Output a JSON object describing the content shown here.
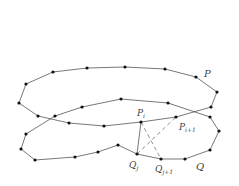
{
  "diagram": {
    "colors": {
      "line": "#555555",
      "point": "#111111",
      "label": "#444444"
    },
    "polygons": {
      "P": {
        "label": "P",
        "points": [
          [
            19,
            103
          ],
          [
            26,
            84
          ],
          [
            53,
            72
          ],
          [
            87,
            68
          ],
          [
            125,
            67
          ],
          [
            165,
            69
          ],
          [
            196,
            77
          ],
          [
            217,
            92
          ],
          [
            211,
            107
          ],
          [
            176,
            117
          ],
          [
            141,
            122
          ],
          [
            104,
            126
          ],
          [
            69,
            123
          ],
          [
            38,
            116
          ]
        ]
      },
      "Q": {
        "label": "Q",
        "points": [
          [
            55,
            116
          ],
          [
            82,
            107
          ],
          [
            121,
            99
          ],
          [
            168,
            103
          ],
          [
            210,
            117
          ],
          [
            219,
            131
          ],
          [
            210,
            150
          ],
          [
            185,
            159
          ],
          [
            161,
            159
          ],
          [
            137,
            154
          ],
          [
            118,
            145
          ],
          [
            98,
            152
          ],
          [
            75,
            157
          ],
          [
            35,
            160
          ],
          [
            21,
            149
          ],
          [
            26,
            134
          ]
        ]
      }
    },
    "connections": [
      {
        "from": "Q_j",
        "to": "P_i",
        "style": "solid"
      },
      {
        "from": "Q_j",
        "to": "P_i+1",
        "style": "dashed"
      },
      {
        "from": "P_i",
        "to": "Q_j+1",
        "style": "dashed"
      }
    ],
    "labels": {
      "P": {
        "text": "P",
        "x": 204,
        "y": 77
      },
      "Q": {
        "text": "Q",
        "x": 196,
        "y": 170
      },
      "P_i": {
        "base": "P",
        "sub": "i",
        "x": 137,
        "y": 116
      },
      "P_i1": {
        "base": "P",
        "sub": "i+1",
        "x": 179,
        "y": 130
      },
      "Q_j": {
        "base": "Q",
        "sub": "j",
        "x": 129,
        "y": 168
      },
      "Q_j1": {
        "base": "Q",
        "sub": "j+1",
        "x": 155,
        "y": 172
      }
    }
  }
}
